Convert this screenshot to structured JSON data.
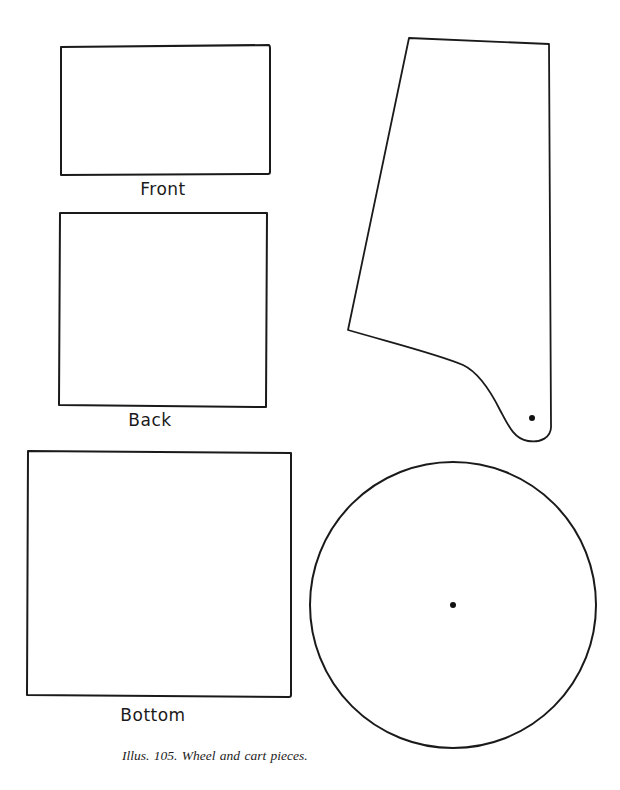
{
  "figure": {
    "caption": "Illus. 105. Wheel and cart pieces.",
    "stroke_color": "#1a1a1a",
    "background": "#ffffff"
  },
  "pieces": {
    "front": {
      "label": "Front"
    },
    "back": {
      "label": "Back"
    },
    "bottom": {
      "label": "Bottom"
    },
    "side": {
      "label": ""
    },
    "wheel": {
      "label": ""
    }
  }
}
